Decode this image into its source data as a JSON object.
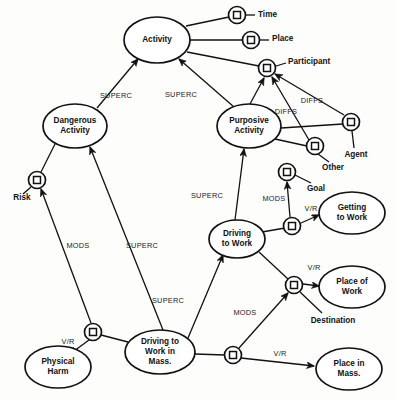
{
  "diagram": {
    "type": "semantic-network",
    "colors": {
      "stroke": "#111111",
      "fill": "#ffffff",
      "background": "#fdfdfc"
    },
    "concepts": [
      {
        "id": "activity",
        "label": "Activity",
        "lines": [
          "Activity"
        ],
        "cx": 157,
        "cy": 40,
        "rx": 33,
        "ry": 23
      },
      {
        "id": "dangerous_activity",
        "label": "Dangerous Activity",
        "lines": [
          "Dangerous",
          "Activity"
        ],
        "cx": 75,
        "cy": 126,
        "rx": 32,
        "ry": 22
      },
      {
        "id": "purposive_activity",
        "label": "Purposive Activity",
        "lines": [
          "Purposive",
          "Activity"
        ],
        "cx": 249,
        "cy": 126,
        "rx": 32,
        "ry": 22
      },
      {
        "id": "driving_to_work",
        "label": "Driving to Work",
        "lines": [
          "Driving",
          "to Work"
        ],
        "cx": 237,
        "cy": 239,
        "rx": 28,
        "ry": 19
      },
      {
        "id": "getting_to_work",
        "label": "Getting to Work",
        "lines": [
          "Getting",
          "to Work"
        ],
        "cx": 352,
        "cy": 213,
        "rx": 33,
        "ry": 21
      },
      {
        "id": "place_of_work",
        "label": "Place of Work",
        "lines": [
          "Place of",
          "Work"
        ],
        "cx": 352,
        "cy": 287,
        "rx": 33,
        "ry": 21
      },
      {
        "id": "place_in_mass",
        "label": "Place in Mass.",
        "lines": [
          "Place in",
          "Mass."
        ],
        "cx": 349,
        "cy": 369,
        "rx": 33,
        "ry": 21
      },
      {
        "id": "driving_mass",
        "label": "Driving to Work in Mass.",
        "lines": [
          "Driving to",
          "Work in",
          "Mass."
        ],
        "cx": 160,
        "cy": 352,
        "rx": 35,
        "ry": 22
      },
      {
        "id": "physical_harm",
        "label": "Physical Harm",
        "lines": [
          "Physical",
          "Harm"
        ],
        "cx": 58,
        "cy": 367,
        "rx": 33,
        "ry": 21
      }
    ],
    "relations": [
      {
        "id": "rel_time",
        "cx": 237,
        "cy": 15,
        "r": 8.5
      },
      {
        "id": "rel_place",
        "cx": 251,
        "cy": 40,
        "r": 8.5
      },
      {
        "id": "rel_participant",
        "cx": 267,
        "cy": 68,
        "r": 8.5
      },
      {
        "id": "rel_agent",
        "cx": 351,
        "cy": 122,
        "r": 8.5
      },
      {
        "id": "rel_other",
        "cx": 315,
        "cy": 146,
        "r": 8.5
      },
      {
        "id": "rel_goal",
        "cx": 287,
        "cy": 172,
        "r": 8.5
      },
      {
        "id": "rel_risk",
        "cx": 37,
        "cy": 180,
        "r": 8.5
      },
      {
        "id": "rel_getting",
        "cx": 292,
        "cy": 226,
        "r": 8.5
      },
      {
        "id": "rel_dest",
        "cx": 294,
        "cy": 285,
        "r": 8.5
      },
      {
        "id": "rel_harm",
        "cx": 93,
        "cy": 332,
        "r": 8.5
      },
      {
        "id": "rel_placemass",
        "cx": 233,
        "cy": 355,
        "r": 8.5
      }
    ],
    "attribute_labels": [
      {
        "id": "time",
        "text": "Time",
        "x": 258,
        "y": 15,
        "anchor": "start"
      },
      {
        "id": "place",
        "text": "Place",
        "x": 272,
        "y": 39,
        "anchor": "start"
      },
      {
        "id": "participant",
        "text": "Participant",
        "x": 288,
        "y": 62,
        "anchor": "start"
      },
      {
        "id": "agent",
        "text": "Agent",
        "x": 356,
        "y": 155,
        "anchor": "middle"
      },
      {
        "id": "other",
        "text": "Other",
        "x": 333,
        "y": 168,
        "anchor": "middle"
      },
      {
        "id": "goal",
        "text": "Goal",
        "x": 316,
        "y": 189,
        "anchor": "middle"
      },
      {
        "id": "risk",
        "text": "Risk",
        "x": 22,
        "y": 198,
        "anchor": "middle"
      },
      {
        "id": "destination",
        "text": "Destination",
        "x": 333,
        "y": 321,
        "anchor": "middle"
      }
    ],
    "edge_labels": [
      {
        "id": "superc_dangerous_activity",
        "text": "SUPERC",
        "x": 116,
        "y": 96
      },
      {
        "id": "superc_purposive_activity",
        "text": "SUPERC",
        "x": 181,
        "y": 95
      },
      {
        "id": "diffs_agent",
        "text": "DIFFS",
        "x": 312,
        "y": 101
      },
      {
        "id": "diffs_other",
        "text": "DIFFS",
        "x": 286,
        "y": 112
      },
      {
        "id": "superc_driving_purposive",
        "text": "SUPERC",
        "x": 207,
        "y": 196
      },
      {
        "id": "mods_goal",
        "text": "MODS",
        "x": 274,
        "y": 199
      },
      {
        "id": "vr_getting",
        "text": "V/R",
        "x": 311,
        "y": 209
      },
      {
        "id": "mods_risk",
        "text": "MODS",
        "x": 78,
        "y": 246
      },
      {
        "id": "superc_dangerous_mass",
        "text": "SUPERC",
        "x": 142,
        "y": 246
      },
      {
        "id": "vr_placeofwork",
        "text": "V/R",
        "x": 314,
        "y": 268
      },
      {
        "id": "superc_driving_mass",
        "text": "SUPERC",
        "x": 168,
        "y": 301
      },
      {
        "id": "mods_destination",
        "text": "MODS",
        "x": 245,
        "y": 313
      },
      {
        "id": "vr_physicalharm",
        "text": "V/R",
        "x": 68,
        "y": 342
      },
      {
        "id": "vr_placemass",
        "text": "V/R",
        "x": 280,
        "y": 354
      }
    ],
    "edges": [
      {
        "id": "e-activity-time",
        "from": "activity",
        "to": "rel_time",
        "arrow": "none",
        "d": "M 186,26 L 229,17"
      },
      {
        "id": "e-time-label",
        "from": "rel_time",
        "to": "time",
        "arrow": "none",
        "d": "M 246,15 L 255,15"
      },
      {
        "id": "e-activity-place",
        "from": "activity",
        "to": "rel_place",
        "arrow": "none",
        "d": "M 190,40 L 243,40"
      },
      {
        "id": "e-place-label",
        "from": "rel_place",
        "to": "place",
        "arrow": "none",
        "d": "M 260,40 L 269,40"
      },
      {
        "id": "e-activity-participant",
        "from": "activity",
        "to": "rel_participant",
        "arrow": "none",
        "d": "M 187,52 L 259,66"
      },
      {
        "id": "e-participant-label",
        "from": "rel_participant",
        "to": "participant",
        "arrow": "none",
        "d": "M 276,66 L 286,63"
      },
      {
        "id": "e-dangerous-activity",
        "from": "dangerous_activity",
        "to": "activity",
        "arrow": "head",
        "d": "M 97,108 L 138,59"
      },
      {
        "id": "e-purposive-activity",
        "from": "purposive_activity",
        "to": "activity",
        "arrow": "head",
        "d": "M 234,107 L 179,59"
      },
      {
        "id": "e-purposive-participant",
        "from": "purposive_activity",
        "to": "rel_participant",
        "arrow": "head",
        "d": "M 250,104 L 264,78"
      },
      {
        "id": "e-purposive-agent",
        "from": "purposive_activity",
        "to": "rel_agent",
        "arrow": "none",
        "d": "M 281,128 L 343,124"
      },
      {
        "id": "e-purposive-other",
        "from": "purposive_activity",
        "to": "rel_other",
        "arrow": "none",
        "d": "M 275,139 L 307,146"
      },
      {
        "id": "e-agent-participant",
        "from": "rel_agent",
        "to": "rel_participant",
        "arrow": "head",
        "d": "M 344,115 L 275,74"
      },
      {
        "id": "e-other-participant",
        "from": "rel_other",
        "to": "rel_participant",
        "arrow": "head",
        "d": "M 309,140 L 272,77"
      },
      {
        "id": "e-agent-label",
        "from": "rel_agent",
        "to": "agent",
        "arrow": "none",
        "d": "M 352,131 L 354,148"
      },
      {
        "id": "e-other-label",
        "from": "rel_other",
        "to": "other",
        "arrow": "none",
        "d": "M 318,154 L 329,162"
      },
      {
        "id": "e-goal-label",
        "from": "rel_goal",
        "to": "goal",
        "arrow": "none",
        "d": "M 295,175 L 311,183"
      },
      {
        "id": "e-driving-purposive",
        "from": "driving_to_work",
        "to": "purposive_activity",
        "arrow": "head",
        "d": "M 235,220 L 244,149"
      },
      {
        "id": "e-driving-goalrel",
        "from": "driving_to_work",
        "to": "rel_getting",
        "arrow": "none",
        "d": "M 262,232 L 285,228"
      },
      {
        "id": "e-getting-goal",
        "from": "rel_getting",
        "to": "rel_goal",
        "arrow": "head",
        "d": "M 290,217 L 287,182"
      },
      {
        "id": "e-getting-work",
        "from": "rel_getting",
        "to": "getting_to_work",
        "arrow": "head",
        "d": "M 301,223 L 319,215"
      },
      {
        "id": "e-driving-destrel",
        "from": "driving_to_work",
        "to": "rel_dest",
        "arrow": "none",
        "d": "M 259,252 L 288,279"
      },
      {
        "id": "e-dest-placeofwork",
        "from": "rel_dest",
        "to": "place_of_work",
        "arrow": "head",
        "d": "M 303,284 L 319,286"
      },
      {
        "id": "e-dest-label",
        "from": "rel_dest",
        "to": "destination",
        "arrow": "none",
        "d": "M 300,292 L 322,313"
      },
      {
        "id": "e-dangerous-riskrel",
        "from": "dangerous_activity",
        "to": "rel_risk",
        "arrow": "none",
        "d": "M 56,142 L 41,172"
      },
      {
        "id": "e-risk-label",
        "from": "rel_risk",
        "to": "risk",
        "arrow": "none",
        "d": "M 31,187 L 23,194"
      },
      {
        "id": "e-drivingmass-dangerous",
        "from": "driving_mass",
        "to": "dangerous_activity",
        "arrow": "head",
        "d": "M 163,330 L 90,147"
      },
      {
        "id": "e-drivingmass-driving",
        "from": "driving_mass",
        "to": "driving_to_work",
        "arrow": "head",
        "d": "M 188,338 L 223,255"
      },
      {
        "id": "e-harmrel-risk",
        "from": "rel_harm",
        "to": "rel_risk",
        "arrow": "head",
        "d": "M 91,323 L 41,189"
      },
      {
        "id": "e-drivingmass-harmrel",
        "from": "driving_mass",
        "to": "rel_harm",
        "arrow": "none",
        "d": "M 128,342 L 101,335"
      },
      {
        "id": "e-harmrel-physicalharm",
        "from": "rel_harm",
        "to": "physical_harm",
        "arrow": "head",
        "d": "M 89,340 L 70,354"
      },
      {
        "id": "e-drivingmass-placemassrel",
        "from": "driving_mass",
        "to": "rel_placemass",
        "arrow": "none",
        "d": "M 195,354 L 225,355"
      },
      {
        "id": "e-placemassrel-dest",
        "from": "rel_placemass",
        "to": "rel_dest",
        "arrow": "head",
        "d": "M 239,348 L 288,293"
      },
      {
        "id": "e-placemassrel-placemass",
        "from": "rel_placemass",
        "to": "place_in_mass",
        "arrow": "head",
        "d": "M 241,358 L 314,366"
      }
    ]
  }
}
